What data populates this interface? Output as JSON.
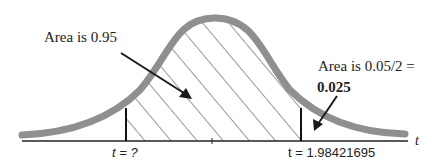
{
  "diagram": {
    "type": "t-distribution two-tailed area diagram",
    "center_label": "Area is 0.95",
    "tail_label_line1": "Area is 0.05/2 =",
    "tail_label_line2": "0.025",
    "left_critical_label": "t = ?",
    "right_critical_label": "t = 1.98421695",
    "axis_label": "t",
    "colors": {
      "curve": "#8f8f8f",
      "hatch": "#333333",
      "axis": "#222222",
      "arrow": "#1a1a1a"
    }
  }
}
